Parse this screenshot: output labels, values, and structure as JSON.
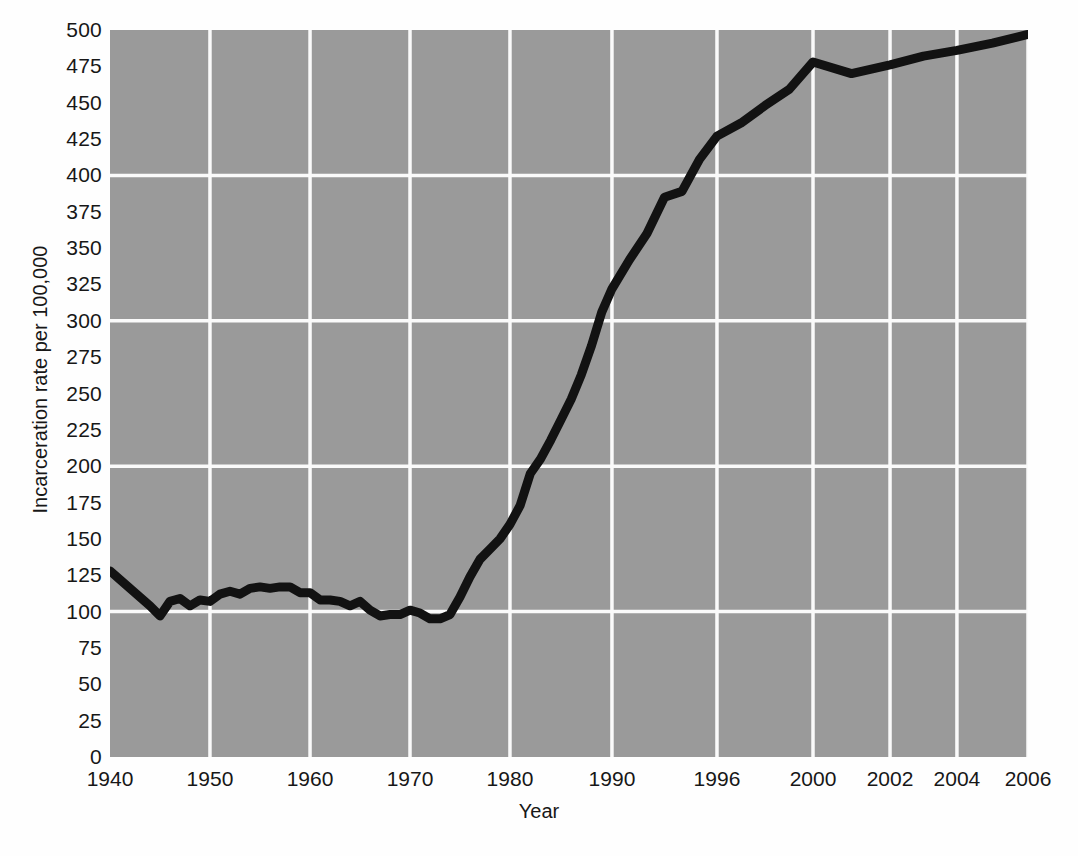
{
  "chart_data": {
    "type": "line",
    "title": "",
    "xlabel": "Year",
    "ylabel": "Incarceration rate per 100,000",
    "xlim": [
      1940,
      2006
    ],
    "ylim": [
      0,
      500
    ],
    "grid": true,
    "legend": false,
    "line_color": "#121212",
    "plot_background": "#9a9a9a",
    "gridline_color": "#fafafa",
    "x_tick_labels": [
      "1940",
      "1950",
      "1960",
      "1970",
      "1980",
      "1990",
      "1996",
      "2000",
      "2002",
      "2004",
      "2006"
    ],
    "x_tick_values": [
      1940,
      1950,
      1960,
      1970,
      1980,
      1990,
      1996,
      2000,
      2002,
      2004,
      2006
    ],
    "y_tick_labels": [
      "500",
      "475",
      "450",
      "425",
      "400",
      "375",
      "350",
      "325",
      "300",
      "275",
      "250",
      "225",
      "200",
      "175",
      "150",
      "125",
      "100",
      "75",
      "50",
      "25",
      "0"
    ],
    "y_tick_values": [
      500,
      475,
      450,
      425,
      400,
      375,
      350,
      325,
      300,
      275,
      250,
      225,
      200,
      175,
      150,
      125,
      100,
      75,
      50,
      25,
      0
    ],
    "y_gridline_values": [
      400,
      300,
      200,
      100
    ],
    "series": [
      {
        "name": "Incarceration rate per 100,000",
        "x": [
          1940,
          1941,
          1942,
          1943,
          1944,
          1945,
          1946,
          1947,
          1948,
          1949,
          1950,
          1951,
          1952,
          1953,
          1954,
          1955,
          1956,
          1957,
          1958,
          1959,
          1960,
          1961,
          1962,
          1963,
          1964,
          1965,
          1966,
          1967,
          1968,
          1969,
          1970,
          1971,
          1972,
          1973,
          1974,
          1975,
          1976,
          1977,
          1978,
          1979,
          1980,
          1981,
          1982,
          1983,
          1984,
          1985,
          1986,
          1987,
          1988,
          1989,
          1990,
          1991,
          1992,
          1993,
          1994,
          1995,
          1996,
          1997,
          1998,
          1999,
          2000,
          2001,
          2002,
          2003,
          2004,
          2005,
          2006
        ],
        "y": [
          128,
          122,
          116,
          110,
          104,
          97,
          107,
          109,
          104,
          108,
          107,
          112,
          114,
          112,
          116,
          117,
          116,
          117,
          117,
          113,
          113,
          108,
          108,
          107,
          104,
          107,
          101,
          97,
          98,
          98,
          101,
          99,
          95,
          95,
          98,
          110,
          124,
          136,
          143,
          150,
          160,
          173,
          195,
          205,
          218,
          232,
          246,
          263,
          283,
          306,
          322,
          342,
          360,
          385,
          389,
          411,
          427,
          436,
          448,
          459,
          478,
          470,
          476,
          482,
          486,
          491,
          497
        ]
      }
    ]
  },
  "axes": {
    "x_title": "Year",
    "y_title": "Incarceration rate per 100,000"
  }
}
